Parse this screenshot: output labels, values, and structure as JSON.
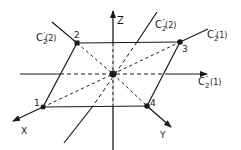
{
  "diagram": {
    "axes": {
      "z": {
        "label": "Z"
      },
      "x": {
        "label": "X"
      },
      "y": {
        "label": "Y"
      }
    },
    "vertices": [
      {
        "id": "1",
        "label": "1"
      },
      {
        "id": "2",
        "label": "2"
      },
      {
        "id": "3",
        "label": "3"
      },
      {
        "id": "4",
        "label": "4"
      }
    ],
    "symmetry_axes": {
      "c2p_2": {
        "base": "C",
        "sub": "2",
        "prime": "′",
        "index": "(2)"
      },
      "c2p_1": {
        "base": "C",
        "sub": "2",
        "prime": "′",
        "index": "(1)"
      },
      "c2pp_2": {
        "base": "C",
        "sub": "2",
        "prime": "″",
        "index": "(2)"
      },
      "c2pp_1": {
        "base": "C",
        "sub": "2",
        "prime": "″",
        "index": "(1)"
      }
    },
    "colors": {
      "ink": "#1a1a1a",
      "background": "#ffffff"
    }
  }
}
